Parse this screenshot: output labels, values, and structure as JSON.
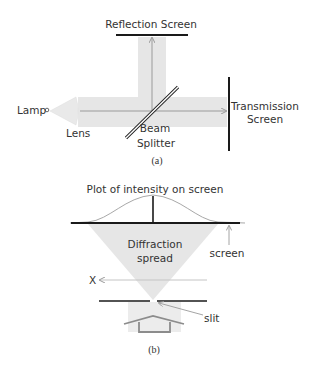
{
  "figure_a": {
    "caption": "(a)",
    "labels": {
      "reflection_screen": "Reflection Screen",
      "lamp": "Lamp",
      "lens": "Lens",
      "beam": "Beam",
      "splitter": "Splitter",
      "transmission": "Transmission",
      "screen": "Screen"
    }
  },
  "figure_b": {
    "caption": "(b)",
    "labels": {
      "plot_title": "Plot of intensity on screen",
      "diffraction": "Diffraction",
      "spread": "spread",
      "screen": "screen",
      "x_axis": "X",
      "slit": "slit"
    }
  },
  "colors": {
    "beam": "#e4e4e4",
    "line": "#1a1a1a",
    "arrow": "#9a9a9a",
    "text": "#333333"
  }
}
